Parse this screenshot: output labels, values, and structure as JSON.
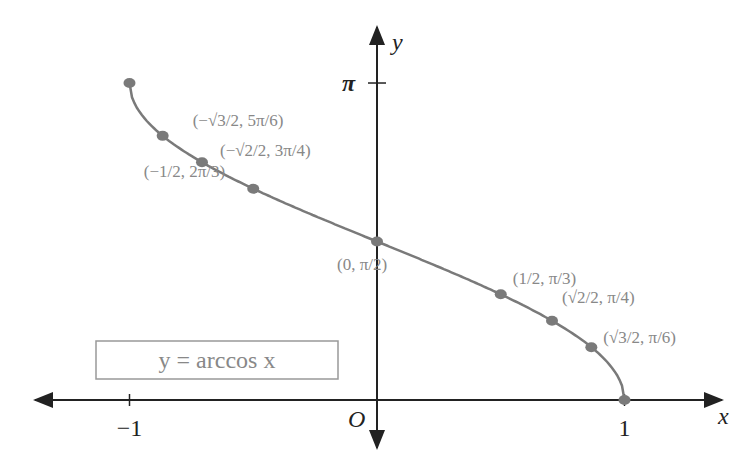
{
  "chart_data": {
    "type": "line",
    "title": "y = arccos x",
    "xlabel": "x",
    "ylabel": "y",
    "origin_label": "O",
    "xlim": [
      -1,
      1
    ],
    "ylim": [
      0,
      3.14159
    ],
    "x_ticks": [
      {
        "value": -1,
        "label": "−1"
      },
      {
        "value": 1,
        "label": "1"
      }
    ],
    "y_ticks": [
      {
        "value": 3.14159,
        "label": "π"
      }
    ],
    "series": [
      {
        "name": "y = arccos x",
        "function": "arccos",
        "domain": [
          -1,
          1
        ]
      }
    ],
    "points": [
      {
        "x": -1,
        "y": 3.14159,
        "label": ""
      },
      {
        "x": -0.866,
        "y": 2.618,
        "label": "(−√3/2, 5π/6)"
      },
      {
        "x": -0.7071,
        "y": 2.3562,
        "label": "(−√2/2, 3π/4)"
      },
      {
        "x": -0.5,
        "y": 2.0944,
        "label": "(−1/2, 2π/3)"
      },
      {
        "x": 0,
        "y": 1.5708,
        "label": "(0, π/2)"
      },
      {
        "x": 0.5,
        "y": 1.0472,
        "label": "(1/2, π/3)"
      },
      {
        "x": 0.7071,
        "y": 0.7854,
        "label": "(√2/2, π/4)"
      },
      {
        "x": 0.866,
        "y": 0.5236,
        "label": "(√3/2, π/6)"
      },
      {
        "x": 1,
        "y": 0,
        "label": ""
      }
    ],
    "colors": {
      "curve": "#7a7a7a",
      "axis": "#222222",
      "label": "#888888"
    }
  }
}
